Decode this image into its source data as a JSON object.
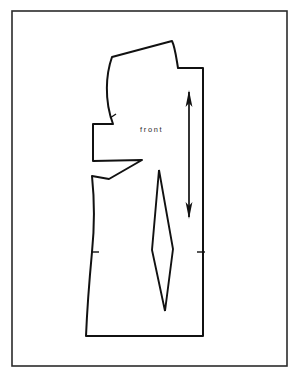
{
  "canvas": {
    "width": 302,
    "height": 381,
    "background_color": "#ffffff",
    "ink_color": "#111111",
    "frame_color": "#2b2b2b"
  },
  "frame": {
    "name": "page-border",
    "x": 12,
    "y": 11,
    "width": 275,
    "height": 355
  },
  "labels": {
    "piece_label": "front",
    "piece_label_x": 155,
    "piece_label_y": 132
  },
  "pattern": {
    "piece_name": "bodice-front",
    "outline_path": "M 172 41 L 112 57 C 106 74 104 100 113 124 L 93 124 L 93 161 L 142 160 L 109 179 L 92 176 C 95 205 94 232 92 252 C 89 284 87 312 86 336 L 203 336 L 203 68 L 178 68 C 176 56 175 47 172 41 Z",
    "notches": [
      {
        "name": "notch-armhole",
        "x1": 110,
        "y1": 118,
        "x2": 116,
        "y2": 114
      },
      {
        "name": "notch-side-seam-waist",
        "x1": 91,
        "y1": 252,
        "x2": 99,
        "y2": 252
      },
      {
        "name": "notch-center-front-waist",
        "x1": 197,
        "y1": 252,
        "x2": 205,
        "y2": 252
      }
    ],
    "waist_dart": {
      "name": "waist-dart",
      "path": "M 159 170 L 152 250 L 165 311 L 173 249 Z"
    },
    "grainline": {
      "name": "grainline-arrow",
      "x": 189,
      "y_top": 90,
      "y_bottom": 219,
      "head_length": 17,
      "head_half_width": 3.4,
      "double_headed": true
    }
  }
}
